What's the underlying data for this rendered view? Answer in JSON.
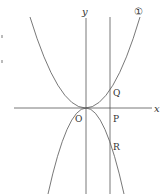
{
  "diagram": {
    "axes": {
      "x_label": "x",
      "y_label": "y",
      "origin_label": "O"
    },
    "curves": [
      {
        "id": "curve-1",
        "label": "①",
        "type": "parabola",
        "opens": "up"
      },
      {
        "id": "curve-2",
        "label": "",
        "type": "parabola",
        "opens": "down"
      }
    ],
    "vertical_line": {
      "type": "line parallel to y-axis"
    },
    "points": [
      {
        "name": "Q",
        "desc": "intersection of vertical line and curve ①"
      },
      {
        "name": "P",
        "desc": "intersection of vertical line and x-axis"
      },
      {
        "name": "R",
        "desc": "intersection of vertical line and lower parabola"
      }
    ],
    "colors": {
      "stroke": "#555555",
      "text": "#333333"
    }
  }
}
